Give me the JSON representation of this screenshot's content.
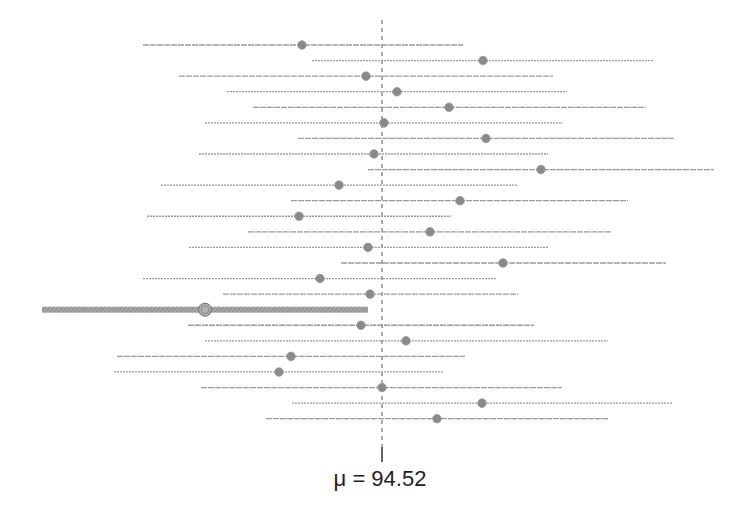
{
  "chart_data": {
    "type": "interval",
    "title": "",
    "reference_line": {
      "label": "μ = 94.52",
      "value": 94.52,
      "style": "dashed"
    },
    "colors": {
      "line": "#9a9a9a",
      "point": "#8a8a8a",
      "highlight": "#8c8c8c",
      "reference": "#555555"
    },
    "intervals": [
      {
        "row": 1,
        "lower_px": 143,
        "upper_px": 463,
        "point_px": 302,
        "highlight": false
      },
      {
        "row": 2,
        "lower_px": 312,
        "upper_px": 654,
        "point_px": 483,
        "highlight": false
      },
      {
        "row": 3,
        "lower_px": 179,
        "upper_px": 553,
        "point_px": 366,
        "highlight": false
      },
      {
        "row": 4,
        "lower_px": 227,
        "upper_px": 567,
        "point_px": 397,
        "highlight": false
      },
      {
        "row": 5,
        "lower_px": 253,
        "upper_px": 646,
        "point_px": 449,
        "highlight": false
      },
      {
        "row": 6,
        "lower_px": 205,
        "upper_px": 563,
        "point_px": 384,
        "highlight": false
      },
      {
        "row": 7,
        "lower_px": 298,
        "upper_px": 674,
        "point_px": 486,
        "highlight": false
      },
      {
        "row": 8,
        "lower_px": 199,
        "upper_px": 548,
        "point_px": 374,
        "highlight": false
      },
      {
        "row": 9,
        "lower_px": 368,
        "upper_px": 714,
        "point_px": 541,
        "highlight": false
      },
      {
        "row": 10,
        "lower_px": 161,
        "upper_px": 517,
        "point_px": 339,
        "highlight": false
      },
      {
        "row": 11,
        "lower_px": 291,
        "upper_px": 628,
        "point_px": 460,
        "highlight": false
      },
      {
        "row": 12,
        "lower_px": 147,
        "upper_px": 451,
        "point_px": 299,
        "highlight": false
      },
      {
        "row": 13,
        "lower_px": 248,
        "upper_px": 611,
        "point_px": 430,
        "highlight": false
      },
      {
        "row": 14,
        "lower_px": 189,
        "upper_px": 548,
        "point_px": 368,
        "highlight": false
      },
      {
        "row": 15,
        "lower_px": 341,
        "upper_px": 666,
        "point_px": 503,
        "highlight": false
      },
      {
        "row": 16,
        "lower_px": 143,
        "upper_px": 497,
        "point_px": 320,
        "highlight": false
      },
      {
        "row": 17,
        "lower_px": 223,
        "upper_px": 518,
        "point_px": 370,
        "highlight": false
      },
      {
        "row": 18,
        "lower_px": 42,
        "upper_px": 368,
        "point_px": 205,
        "highlight": true
      },
      {
        "row": 19,
        "lower_px": 188,
        "upper_px": 534,
        "point_px": 361,
        "highlight": false
      },
      {
        "row": 20,
        "lower_px": 205,
        "upper_px": 608,
        "point_px": 406,
        "highlight": false
      },
      {
        "row": 21,
        "lower_px": 117,
        "upper_px": 465,
        "point_px": 291,
        "highlight": false
      },
      {
        "row": 22,
        "lower_px": 114,
        "upper_px": 444,
        "point_px": 279,
        "highlight": false
      },
      {
        "row": 23,
        "lower_px": 201,
        "upper_px": 562,
        "point_px": 382,
        "highlight": false
      },
      {
        "row": 24,
        "lower_px": 292,
        "upper_px": 672,
        "point_px": 482,
        "highlight": false
      },
      {
        "row": 25,
        "lower_px": 266,
        "upper_px": 609,
        "point_px": 437,
        "highlight": false
      }
    ],
    "layout": {
      "center_x": 382,
      "first_row_y": 45,
      "row_spacing": 15.57,
      "axis_top": 20,
      "axis_bottom": 447,
      "tick_bottom": 462,
      "grid": false,
      "legend": "none"
    }
  },
  "label": {
    "mu": "μ = 94.52"
  }
}
